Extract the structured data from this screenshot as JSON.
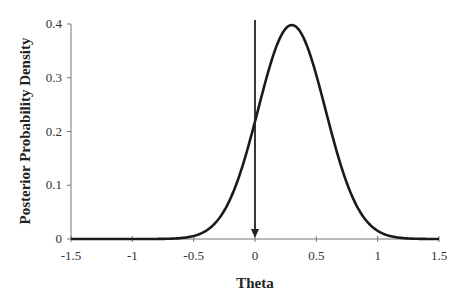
{
  "chart_data": {
    "type": "line",
    "title": "",
    "xlabel": "Theta",
    "ylabel": "Posterior Probability Density",
    "xlim": [
      -1.5,
      1.5
    ],
    "ylim": [
      0,
      0.4
    ],
    "x_ticks": [
      "-1.5",
      "-1",
      "-0.5",
      "0",
      "0.5",
      "1",
      "1.5"
    ],
    "y_ticks": [
      "0",
      "0.1",
      "0.2",
      "0.3",
      "0.4"
    ],
    "grid": false,
    "legend": null,
    "series": [
      {
        "name": "posterior",
        "x": [
          -1.5,
          -1.0,
          -0.75,
          -0.5,
          -0.4,
          -0.3,
          -0.2,
          -0.1,
          0.0,
          0.1,
          0.2,
          0.3,
          0.4,
          0.5,
          0.6,
          0.7,
          0.8,
          0.9,
          1.0,
          1.1,
          1.25,
          1.5
        ],
        "values": [
          0.0,
          0.0,
          0.001,
          0.008,
          0.017,
          0.035,
          0.065,
          0.109,
          0.22,
          0.27,
          0.349,
          0.398,
          0.373,
          0.31,
          0.22,
          0.138,
          0.075,
          0.035,
          0.015,
          0.005,
          0.001,
          0.0
        ]
      }
    ],
    "annotations": [
      {
        "type": "arrow",
        "x": 0,
        "from_y": 0.41,
        "to_y": 0,
        "direction": "down"
      }
    ]
  }
}
